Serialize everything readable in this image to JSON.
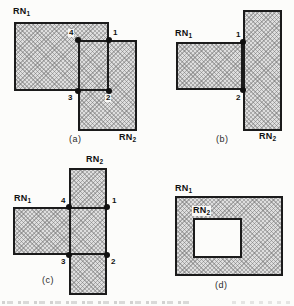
{
  "figure": {
    "panels": {
      "a": {
        "caption": "(a)",
        "rn1_base": "RN",
        "rn1_sub": "1",
        "rn2_base": "RN",
        "rn2_sub": "2",
        "points": {
          "p1": "1",
          "p2": "2",
          "p3": "3",
          "p4": "4"
        }
      },
      "b": {
        "caption": "(b)",
        "rn1_base": "RN",
        "rn1_sub": "1",
        "rn2_base": "RN",
        "rn2_sub": "2",
        "points": {
          "p1": "1",
          "p2": "2"
        }
      },
      "c": {
        "caption": "(c)",
        "rn1_base": "RN",
        "rn1_sub": "1",
        "rn2_base": "RN",
        "rn2_sub": "2",
        "points": {
          "p1": "1",
          "p2": "2",
          "p3": "3",
          "p4": "4"
        }
      },
      "d": {
        "caption": "(d)",
        "rn1_base": "RN",
        "rn1_sub": "1",
        "rn2_base": "RN",
        "rn2_sub": "2"
      }
    },
    "colors": {
      "outline": "#1b1b1b",
      "hatch_base": "#dedede",
      "hatch_line": "#6e6e6e",
      "label": "#111111",
      "background": "#fcfcfa"
    }
  }
}
